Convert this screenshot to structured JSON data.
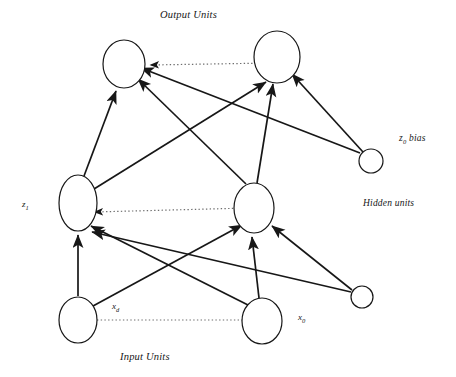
{
  "figure": {
    "title": "Output Units",
    "background_color": "#ffffff",
    "stroke_color": "#171717",
    "dotted_color": "#6e6e6e"
  },
  "labels": {
    "output_units": "Output Units",
    "input_units": "Input Units",
    "hidden_units": "Hidden units",
    "z0_bias": "z",
    "z0_bias_sub": "0",
    "z0_bias_tail": " bias",
    "z1": "z",
    "z1_sub": "1",
    "xd": "x",
    "xd_sub": "d",
    "x0": "x",
    "x0_sub": "0"
  },
  "network": {
    "layers": [
      {
        "name": "output",
        "node_shape": "ellipse",
        "nodes": [
          {
            "id": "y1",
            "cx": 124,
            "cy": 64,
            "rx": 21,
            "ry": 24
          },
          {
            "id": "y2",
            "cx": 277,
            "cy": 57,
            "rx": 23,
            "ry": 26
          }
        ]
      },
      {
        "name": "hidden",
        "node_shape": "ellipse",
        "nodes": [
          {
            "id": "z1",
            "cx": 78,
            "cy": 203,
            "rx": 19,
            "ry": 28
          },
          {
            "id": "z2",
            "cx": 254,
            "cy": 208,
            "rx": 20,
            "ry": 25
          }
        ]
      },
      {
        "name": "input",
        "node_shape": "ellipse",
        "nodes": [
          {
            "id": "x1",
            "cx": 78,
            "cy": 320,
            "rx": 19,
            "ry": 23
          },
          {
            "id": "x2",
            "cx": 262,
            "cy": 321,
            "rx": 20,
            "ry": 23
          }
        ]
      },
      {
        "name": "bias",
        "node_shape": "circle",
        "nodes": [
          {
            "id": "z0bias",
            "cx": 371,
            "cy": 161,
            "rx": 12,
            "ry": 12
          },
          {
            "id": "x0bias",
            "cx": 362,
            "cy": 297,
            "rx": 11,
            "ry": 11
          }
        ]
      }
    ],
    "edges": [
      {
        "from": "z1",
        "to": "y1",
        "style": "arrow"
      },
      {
        "from": "z1",
        "to": "y2",
        "style": "arrow"
      },
      {
        "from": "z2",
        "to": "y1",
        "style": "arrow"
      },
      {
        "from": "z2",
        "to": "y2",
        "style": "arrow"
      },
      {
        "from": "z0bias",
        "to": "y1",
        "style": "arrow"
      },
      {
        "from": "z0bias",
        "to": "y2",
        "style": "arrow"
      },
      {
        "from": "x1",
        "to": "z1",
        "style": "arrow"
      },
      {
        "from": "x1",
        "to": "z2",
        "style": "arrow"
      },
      {
        "from": "x2",
        "to": "z1",
        "style": "arrow"
      },
      {
        "from": "x2",
        "to": "z2",
        "style": "arrow"
      },
      {
        "from": "x0bias",
        "to": "z1",
        "style": "arrow"
      },
      {
        "from": "x0bias",
        "to": "z2",
        "style": "arrow"
      }
    ],
    "peer_connectors": [
      {
        "between": [
          "y1",
          "y2"
        ],
        "style": "dotted"
      },
      {
        "between": [
          "z1",
          "z2"
        ],
        "style": "dotted"
      },
      {
        "between": [
          "x1",
          "x2"
        ],
        "style": "dotted"
      }
    ]
  }
}
